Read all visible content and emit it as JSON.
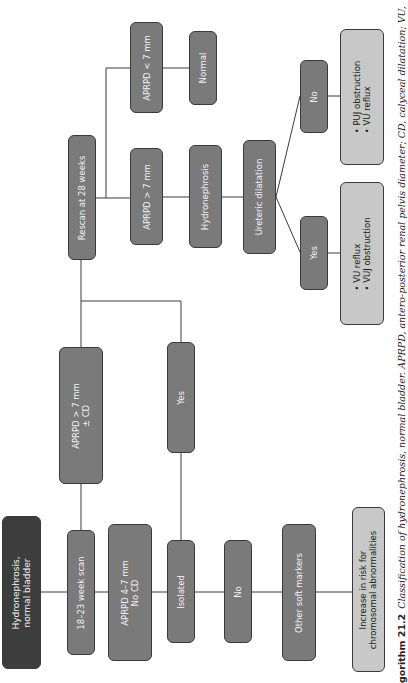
{
  "diagram": {
    "orientation": "rotated 90 degrees counter-clockwise",
    "colors": {
      "dark": "#3d3d3d",
      "mid": "#7a7a7a",
      "light": "#c8c8c8",
      "line": "#3a3a3a"
    },
    "nodes": {
      "root": "Hydronephrosis,\nnormal bladder",
      "scan_18_23": "18–23 week scan",
      "aprpd_4_7": {
        "line1": "APRPD 4–7 mm",
        "line2": "No CD"
      },
      "aprpd_gt7_cd": {
        "line1": "APRPD > 7 mm",
        "line2": "± CD"
      },
      "isolated": "Isolated",
      "yes_left": "Yes",
      "no_left": "No",
      "other_soft_markers": "Other soft markers",
      "increase_risk": {
        "line1": "Increase in risk for",
        "line2": "chromosomal abnormalities"
      },
      "rescan_28": "Rescan at 28 weeks",
      "aprpd_gt7": "APRPD > 7 mm",
      "aprpd_lt7": "APRPD < 7 mm",
      "normal": "Normal",
      "hydronephrosis": "Hydronephrosis",
      "ureteric_dilatation": "Ureteric dilatation",
      "yes_right": "Yes",
      "no_right": "No",
      "outcome_yes": {
        "items": [
          "VU reflux",
          "VUJ obstruction"
        ]
      },
      "outcome_no": {
        "items": [
          "PUJ obstruction",
          "VU reflux"
        ]
      }
    }
  },
  "caption": {
    "label": "gorithm 21.2",
    "text": "Classification of hydronephrosis, normal bladder. APRPD, antero-posterior renal pelvis diameter; CD, calyceal dilatation; VU,"
  }
}
